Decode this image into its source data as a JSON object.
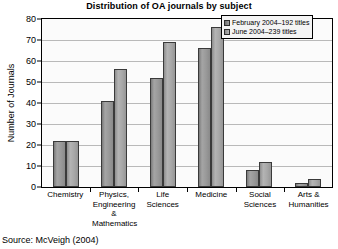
{
  "chart_data": {
    "type": "bar",
    "title": "Distribution of OA journals by subject",
    "xlabel": "",
    "ylabel": "Number of Journals",
    "ylim": [
      0,
      80
    ],
    "yticks": [
      0,
      10,
      20,
      30,
      40,
      50,
      60,
      70,
      80
    ],
    "grid": true,
    "legend_position": "top-right",
    "categories": [
      "Chemistry",
      "Physics, Engineering & Mathematics",
      "Life Sciences",
      "Medicine",
      "Social Sciences",
      "Arts & Humanities"
    ],
    "category_lines": [
      [
        "Chemistry"
      ],
      [
        "Physics,",
        "Engineering",
        "&",
        "Mathematics"
      ],
      [
        "Life Sciences"
      ],
      [
        "Medicine"
      ],
      [
        "Social",
        "Sciences"
      ],
      [
        "Arts &",
        "Humanities"
      ]
    ],
    "series": [
      {
        "name": "February 2004–192 titles",
        "values": [
          22,
          41,
          52,
          66,
          8,
          2
        ],
        "color": "#9a9a9a"
      },
      {
        "name": "June 2004–239 titles",
        "values": [
          22,
          56,
          69,
          76,
          12,
          4
        ],
        "color": "#b0b0b0"
      }
    ]
  },
  "source_note": "Source: McVeigh (2004)"
}
